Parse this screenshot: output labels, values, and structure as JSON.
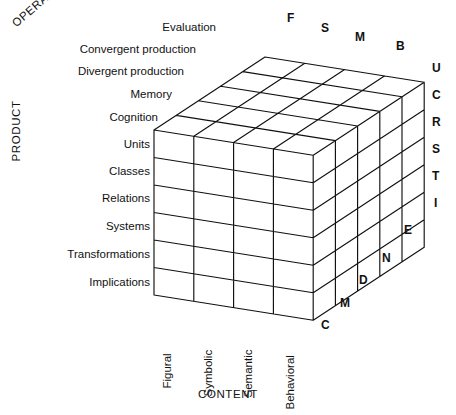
{
  "diagram": {
    "axes": {
      "operation_label": "OPERATION",
      "product_label": "PRODUCT",
      "content_label": "CONTENT"
    },
    "operations": [
      {
        "name": "Cognition",
        "code": "C"
      },
      {
        "name": "Memory",
        "code": "M"
      },
      {
        "name": "Divergent production",
        "code": "D"
      },
      {
        "name": "Convergent production",
        "code": "N"
      },
      {
        "name": "Evaluation",
        "code": "E"
      }
    ],
    "products": [
      {
        "name": "Units",
        "code": "U"
      },
      {
        "name": "Classes",
        "code": "C"
      },
      {
        "name": "Relations",
        "code": "R"
      },
      {
        "name": "Systems",
        "code": "S"
      },
      {
        "name": "Transformations",
        "code": "T"
      },
      {
        "name": "Implications",
        "code": "I"
      }
    ],
    "contents": [
      {
        "name": "Figural",
        "code": "F"
      },
      {
        "name": "Symbolic",
        "code": "S"
      },
      {
        "name": "Semantic",
        "code": "M"
      },
      {
        "name": "Behavioral",
        "code": "B"
      }
    ],
    "colors": {
      "line": "#111111",
      "text": "#111111",
      "background": "#ffffff"
    }
  }
}
